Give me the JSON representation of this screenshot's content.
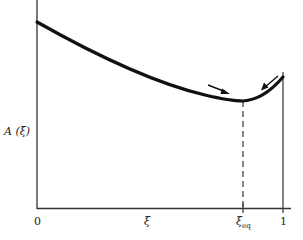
{
  "diagram": {
    "y_axis_label": "A (ξ)",
    "x_axis_label": "ξ",
    "x_ticks": {
      "zero": "0",
      "eq_symbol": "ξ",
      "eq_subscript": "eq",
      "one": "1"
    },
    "curve_description": "Free energy A(ξ) decreasing from ξ=0 to a minimum at ξ_eq, then rising toward ξ=1",
    "arrows": [
      "arrow pointing downhill toward minimum from left",
      "arrow pointing downhill toward minimum from right"
    ],
    "colors": {
      "ink": "#111111",
      "background": "#ffffff"
    }
  }
}
